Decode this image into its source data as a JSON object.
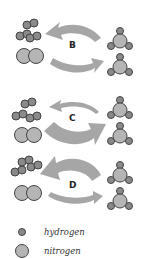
{
  "colors": {
    "arrow": "#a6a6a6",
    "atom_fill": "#b5b5b5",
    "atom_stroke": "#444444",
    "hydrogen_fill": "#8a8a8a",
    "label": "#222222",
    "background": "#ffffff"
  },
  "panels": [
    {
      "label": "B",
      "forward_arrow": "medium",
      "reverse_arrow": "medium"
    },
    {
      "label": "C",
      "forward_arrow": "large",
      "reverse_arrow": "small"
    },
    {
      "label": "D",
      "forward_arrow": "small",
      "reverse_arrow": "large"
    }
  ],
  "reactants": "3 H2 + N2",
  "products": "2 NH3",
  "legend": {
    "hydrogen": "hydrogen",
    "nitrogen": "nitrogen"
  }
}
